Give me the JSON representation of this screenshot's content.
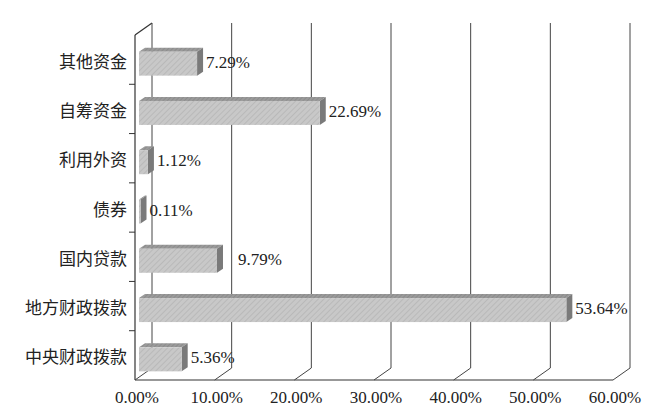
{
  "chart_data": {
    "type": "bar",
    "orientation": "horizontal",
    "style": "3d",
    "title": "",
    "xlabel": "",
    "ylabel": "",
    "categories": [
      "其他资金",
      "自筹资金",
      "利用外资",
      "债券",
      "国内贷款",
      "地方财政拨款",
      "中央财政拨款"
    ],
    "values": [
      7.29,
      22.69,
      1.12,
      0.11,
      9.79,
      53.64,
      5.36
    ],
    "value_labels": [
      "7.29%",
      "22.69%",
      "1.12%",
      "0.11%",
      "9.79%",
      "53.64%",
      "5.36%"
    ],
    "xlim": [
      0,
      60
    ],
    "xticks": [
      0,
      10,
      20,
      30,
      40,
      50,
      60
    ],
    "xtick_labels": [
      "0.00%",
      "10.00%",
      "20.00%",
      "30.00%",
      "40.00%",
      "50.00%",
      "60.00%"
    ],
    "grid": true,
    "legend": null,
    "colors": {
      "bar_front": "#c4c4c4",
      "bar_top": "#8a8a8a",
      "bar_side": "#7a7a7a",
      "axis": "#333333",
      "grid": "#444444"
    }
  }
}
